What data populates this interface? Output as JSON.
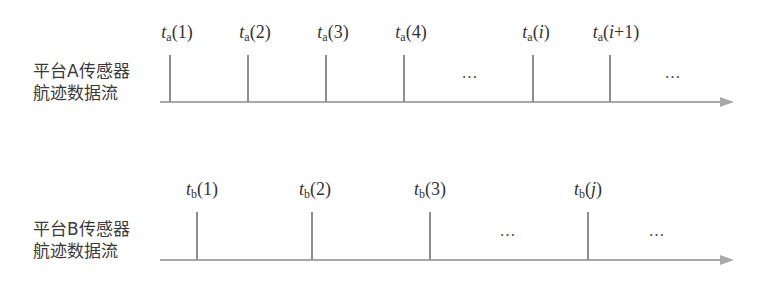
{
  "diagram": {
    "type": "timeline",
    "streams": [
      {
        "id": "A",
        "label_line1": "平台A传感器",
        "label_line2": "航迹数据流",
        "ticks": [
          {
            "var": "t",
            "sub": "a",
            "arg": "(1)",
            "arg_italic": false,
            "x": 170
          },
          {
            "var": "t",
            "sub": "a",
            "arg": "(2)",
            "arg_italic": false,
            "x": 248
          },
          {
            "var": "t",
            "sub": "a",
            "arg": "(3)",
            "arg_italic": false,
            "x": 326
          },
          {
            "var": "t",
            "sub": "a",
            "arg": "(4)",
            "arg_italic": false,
            "x": 404
          },
          {
            "var": "t",
            "sub": "a",
            "arg_pre": "(",
            "arg_var": "i",
            "arg_post": ")",
            "x": 533
          },
          {
            "var": "t",
            "sub": "a",
            "arg_pre": "(",
            "arg_var": "i",
            "arg_post": "+1)",
            "x": 610
          }
        ],
        "ellipses": [
          "…",
          "…"
        ]
      },
      {
        "id": "B",
        "label_line1": "平台B传感器",
        "label_line2": "航迹数据流",
        "ticks": [
          {
            "var": "t",
            "sub": "b",
            "arg": "(1)",
            "x": 197
          },
          {
            "var": "t",
            "sub": "b",
            "arg": "(2)",
            "x": 312
          },
          {
            "var": "t",
            "sub": "b",
            "arg": "(3)",
            "x": 430
          },
          {
            "var": "t",
            "sub": "b",
            "arg_pre": "(",
            "arg_var": "j",
            "arg_post": ")",
            "x": 588
          }
        ],
        "ellipses": [
          "…",
          "…"
        ]
      }
    ],
    "colors": {
      "axis": "#a8a8a8",
      "tick": "#8e8e8e",
      "text": "#333333"
    }
  }
}
